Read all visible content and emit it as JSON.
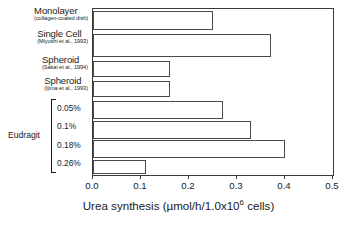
{
  "chart_data": {
    "type": "bar",
    "orientation": "horizontal",
    "title": "",
    "xlabel": "Urea synthesis (µmol/h/1.0x10⁶ cells)",
    "ylabel": "",
    "xlim": [
      0.0,
      0.5
    ],
    "xticks": [
      "0.0",
      "0.1",
      "0.2",
      "0.3",
      "0.4",
      "0.5"
    ],
    "xtick_values": [
      0.0,
      0.1,
      0.2,
      0.3,
      0.4,
      0.5
    ],
    "grid": false,
    "legend": "none",
    "bar_facecolor": "#ffffff",
    "bar_edgecolor": "#4a4a4a",
    "categories": [
      "Monolayer (collagen-coated dish)",
      "Single Cell (Miyoshi et al., 1993)",
      "Spheroid (Sakai et al., 1994)",
      "Spheroid (Ijima et al., 1993)",
      "Eudragit 0.05%",
      "Eudragit 0.1%",
      "Eudragit 0.18%",
      "Eudragit 0.26%"
    ],
    "values": [
      0.25,
      0.37,
      0.16,
      0.16,
      0.27,
      0.33,
      0.4,
      0.11
    ]
  },
  "axis_title": {
    "pre": "Urea synthesis (µmol/h/1.0x10",
    "sup": "6",
    "post": " cells)"
  },
  "labels": [
    {
      "main": "Monolayer",
      "cite": "(collagen-coated dish)"
    },
    {
      "main": "Single Cell",
      "cite": "(Miyoshi et al., 1993)"
    },
    {
      "main": "Spheroid",
      "cite": "(Sakai et al., 1994)"
    },
    {
      "main": "Spheroid",
      "cite": "(Ijima et al., 1993)"
    }
  ],
  "group": {
    "name": "Eudragit",
    "items": [
      "0.05%",
      "0.1%",
      "0.18%",
      "0.26%"
    ]
  },
  "ticks": [
    "0.0",
    "0.1",
    "0.2",
    "0.3",
    "0.4",
    "0.5"
  ]
}
